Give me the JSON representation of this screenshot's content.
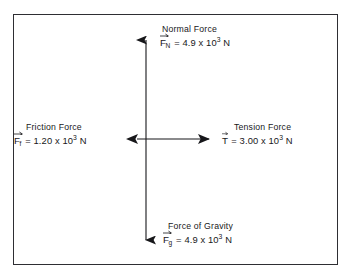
{
  "diagram": {
    "name": "free-body-force-diagram",
    "border_color": "#2e2e33",
    "background_color": "#ffffff",
    "ink_color": "#17171a",
    "axes": {
      "center_x": 146,
      "center_y": 139,
      "vertical_top_y": 30,
      "vertical_bottom_y": 250,
      "horizontal_left_x": 126,
      "horizontal_right_x": 219
    },
    "forces": [
      {
        "id": "normal-force",
        "title": "Normal Force",
        "symbol": "F",
        "subscript": "N",
        "equals": "=",
        "coefficient": "4.9",
        "times": "x",
        "base": "10",
        "exponent": "3",
        "unit": "N",
        "direction": "up",
        "equation_text": "F_N = 4.9 x 10^3 N"
      },
      {
        "id": "friction-force",
        "title": "Friction Force",
        "symbol": "F",
        "subscript": "f",
        "equals": "=",
        "coefficient": "1.20",
        "times": "x",
        "base": "10",
        "exponent": "3",
        "unit": "N",
        "direction": "left",
        "equation_text": "F_f = 1.20 x 10^3 N"
      },
      {
        "id": "tension-force",
        "title": "Tension Force",
        "symbol": "T",
        "subscript": "",
        "equals": "=",
        "coefficient": "3.00",
        "times": "x",
        "base": "10",
        "exponent": "3",
        "unit": "N",
        "direction": "right",
        "equation_text": "T = 3.00 x 10^3 N"
      },
      {
        "id": "force-of-gravity",
        "title": "Force of Gravity",
        "symbol": "F",
        "subscript": "g",
        "equals": "=",
        "coefficient": "4.9",
        "times": "x",
        "base": "10",
        "exponent": "3",
        "unit": "N",
        "direction": "down",
        "equation_text": "F_g = 4.9 x 10^3 N"
      }
    ]
  }
}
